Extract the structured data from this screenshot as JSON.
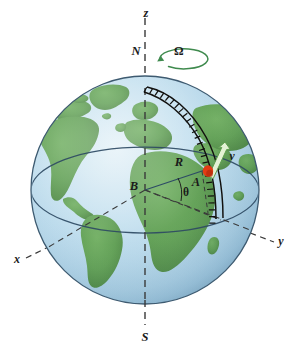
{
  "figure": {
    "background_color": "#ffffff",
    "width": 290,
    "height": 347
  },
  "globe": {
    "center_x": 145,
    "center_y": 190,
    "radius": 114,
    "ocean_color": "#b7d8ea",
    "ocean_color_light": "#d4e9f3",
    "land_color": "#5e9e52",
    "land_color_dark": "#4d8a44",
    "outline_color": "#3d5a70",
    "equator_color": "#2e4a63",
    "equator_label": ""
  },
  "labels": {
    "z_axis": "z",
    "north_pole": "N",
    "south_pole": "S",
    "omega": "Ω",
    "x_axis": "x",
    "y_axis": "y",
    "center": "B",
    "radius": "R",
    "point": "A",
    "theta": "θ",
    "velocity": "v"
  },
  "colors": {
    "omega_green": "#3f8a4e",
    "velocity_arrow_fill": "#e3f2d4",
    "velocity_arrow_stroke": "#5f9e4e",
    "point_marker": "#e23b13",
    "point_marker_dark": "#b32c0c",
    "track_color": "#12110f",
    "axis_dash_color": "#3a3a3a",
    "label_color": "#1a1a1a",
    "radius_line_color": "#2d4a66"
  },
  "axes": {
    "z": {
      "x1": 145,
      "y1": 20,
      "x2": 145,
      "y2": 320,
      "style": "dashed"
    },
    "x": {
      "x1": 28,
      "y1": 257,
      "x2": 152,
      "y2": 196,
      "style": "dashed"
    },
    "y": {
      "x1": 152,
      "y1": 196,
      "x2": 272,
      "y2": 242,
      "style": "dashed"
    }
  },
  "geometry": {
    "theta_description": "angle between equatorial plane radius and line BA",
    "omega_description": "rotation of Earth about the z axis, counterclockwise viewed from north",
    "track_description": "railroad-style meridian track from north pole through point A to the equator",
    "velocity_description": "tangential velocity arrow at point A pointing up along track"
  }
}
